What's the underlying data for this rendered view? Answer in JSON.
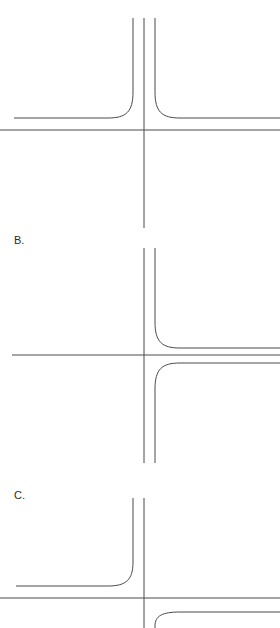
{
  "figure": {
    "width": 280,
    "height": 628,
    "background_color": "#ffffff",
    "line_color": "#4a4a4a",
    "line_width": 1,
    "label_color": "#2b2b2b",
    "label_font_size": 11
  },
  "panels": [
    {
      "id": "panel-a",
      "label": "",
      "label_visible": false,
      "label_x": 14,
      "label_y": 14,
      "description": "T-intersection: vertical road from top meets horizontal road; both upper corners have curved flares (fillets) opening outward to the left and right.",
      "elements": {
        "center_line": {
          "name": "vertical-centerline",
          "d": "M 144 18 L 144 228"
        },
        "left_edge_with_fillet": {
          "name": "vertical-left-edge-curving-left",
          "d": "M 133 18 L 133 92 C 133 112 126 118 108 118 L 14 118"
        },
        "right_edge_with_fillet": {
          "name": "vertical-right-edge-curving-right",
          "d": "M 155 18 L 155 92 C 155 112 162 118 180 118 L 280 118"
        },
        "horizontal_lower_edge": {
          "name": "horizontal-road-lower-edge",
          "d": "M 0 130 L 280 130"
        }
      }
    },
    {
      "id": "panel-b",
      "label": "B.",
      "label_visible": true,
      "label_x": 14,
      "label_y": 244,
      "description": "Cross intersection: a continuous vertical road and a horizontal road; the right-hand vertical edge flares out to the right both above and below the horizontal road.",
      "elements": {
        "center_line": {
          "name": "vertical-centerline",
          "d": "M 144 248 L 144 463"
        },
        "upper_right_fillet": {
          "name": "vertical-right-edge-upper-curving-right",
          "d": "M 155 248 L 155 322 C 155 342 162 348 180 348 L 280 348"
        },
        "lower_right_fillet": {
          "name": "vertical-right-edge-lower-curving-right",
          "d": "M 155 463 L 155 389 C 155 369 162 363 180 363 L 280 363"
        },
        "horizontal_line": {
          "name": "horizontal-road-line",
          "d": "M 12 355 L 280 355"
        }
      }
    },
    {
      "id": "panel-c",
      "label": "C.",
      "label_visible": true,
      "label_x": 14,
      "label_y": 499,
      "description": "Intersection: vertical road from top, the left vertical edge flares left onto the horizontal road; a lower-right curved flare rises from the bottom-right.",
      "elements": {
        "center_line": {
          "name": "vertical-centerline",
          "d": "M 144 498 L 144 628"
        },
        "left_edge_with_fillet": {
          "name": "vertical-left-edge-curving-left",
          "d": "M 133 498 L 133 562 C 133 580 126 586 108 586 L 16 586"
        },
        "horizontal_lower_edge": {
          "name": "horizontal-road-lower-edge",
          "d": "M 0 598 L 280 598"
        },
        "lower_right_fillet": {
          "name": "lower-right-edge-curving-right",
          "d": "M 155 628 L 155 626 C 155 616 162 612 180 612 L 280 612"
        }
      }
    }
  ]
}
